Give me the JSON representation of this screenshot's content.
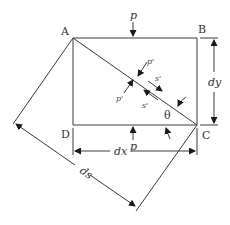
{
  "diagram": {
    "points": {
      "A": "A",
      "B": "B",
      "C": "C",
      "D": "D"
    },
    "labels": {
      "p_top": "p",
      "p_bottom": "p",
      "dy": "dy",
      "dx": "dx",
      "ds": "ds",
      "theta": "θ",
      "p_prime_upper": "p'",
      "p_prime_lower": "p'",
      "s_prime_upper": "s'",
      "s_prime_lower": "s'"
    },
    "colors": {
      "line": "#3a3a3a",
      "text": "#333333",
      "background": "#ffffff"
    }
  }
}
